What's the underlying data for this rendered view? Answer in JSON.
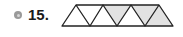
{
  "problem": {
    "number": "15.",
    "icon": "circle-bullet-icon"
  },
  "figure": {
    "triangle_count": 7,
    "shaded_indices": [
      4,
      6,
      7
    ],
    "colors": {
      "stroke": "#222222",
      "shade": "#e2e2e2",
      "unshaded": "#ffffff"
    }
  }
}
